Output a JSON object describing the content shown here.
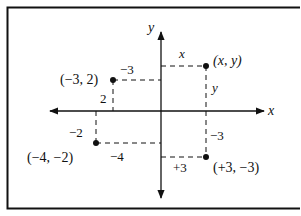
{
  "diagram": {
    "axes": {
      "x_label": "x",
      "y_label": "y"
    },
    "points": [
      {
        "id": "general",
        "label": "(x, y)",
        "horizontal_label": "x",
        "vertical_label": "y"
      },
      {
        "id": "neg3-2",
        "label": "(−3, 2)",
        "horizontal_label": "−3",
        "vertical_label": "2"
      },
      {
        "id": "neg4-neg2",
        "label": "(−4, −2)",
        "horizontal_label": "−4",
        "vertical_label": "−2"
      },
      {
        "id": "pos3-neg3",
        "label": "(+3, −3)",
        "horizontal_label": "+3",
        "vertical_label": "−3"
      }
    ],
    "colors": {
      "ink": "#111111",
      "background": "#ffffff"
    }
  }
}
